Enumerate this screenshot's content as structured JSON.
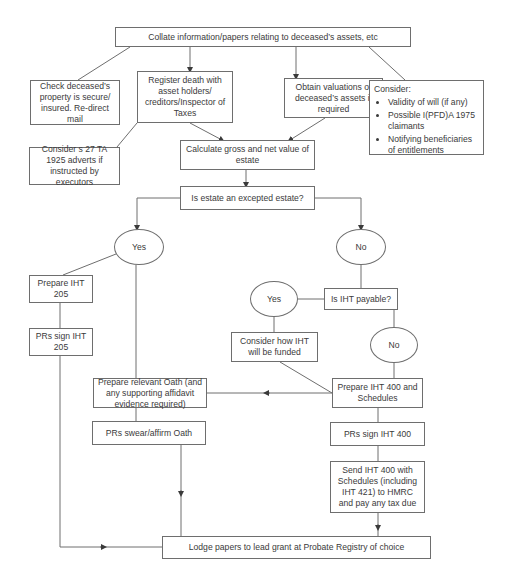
{
  "diagram": {
    "type": "flowchart",
    "nodes": {
      "collate": "Collate information/papers relating to deceased’s assets, etc",
      "check_property": "Check deceased’s property is secure/ insured. Re-direct mail",
      "register_death": "Register death with asset holders/ creditors/Inspector of Taxes",
      "obtain_valuations": "Obtain valuations of deceased’s assets if required",
      "consider": {
        "title": "Consider:",
        "items": [
          "Validity of will (if any)",
          "Possible I(PFD)A 1975 claimants",
          "Notifying beneficiaries of entitlements"
        ]
      },
      "consider_s27": "Consider s 27 TA 1925 adverts if instructed by executors",
      "calculate_value": "Calculate gross and net value of estate",
      "excepted_estate": "Is estate an excepted estate?",
      "yes_excepted": "Yes",
      "no_excepted": "No",
      "prepare_iht205": "Prepare IHT 205",
      "prs_sign_iht205": "PRs sign IHT 205",
      "iht_payable": "Is IHT payable?",
      "yes_payable": "Yes",
      "no_payable": "No",
      "consider_funding": "Consider how IHT will be funded",
      "prepare_oath": "Prepare relevant Oath (and any supporting affidavit evidence required)",
      "prepare_iht400": "Prepare IHT 400 and Schedules",
      "prs_swear_oath": "PRs swear/affirm Oath",
      "prs_sign_iht400": "PRs sign IHT 400",
      "send_iht400": "Send IHT 400 with Schedules (including IHT 421) to HMRC and pay any tax due",
      "lodge_papers": "Lodge papers to lead grant at Probate Registry of choice"
    },
    "colors": {
      "line": "#6e6e6e",
      "text": "#3a3a3a",
      "background": "#ffffff"
    }
  }
}
